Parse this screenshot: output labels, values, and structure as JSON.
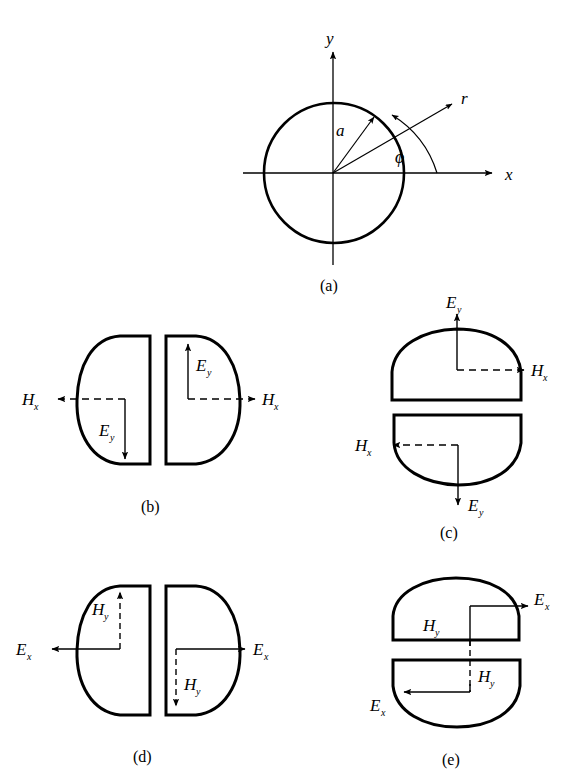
{
  "figure": {
    "background_color": "#ffffff",
    "stroke_color": "#000000"
  },
  "panels": [
    {
      "id": "a",
      "caption": "(a)",
      "description": "Circular cross-section with polar coordinate system",
      "labels": {
        "y_axis": "y",
        "x_axis": "x",
        "radius": "a",
        "radial": "r",
        "angle": "ϕ"
      }
    },
    {
      "id": "b",
      "caption": "(b)",
      "description": "Two vertical D-shaped lobes, solid E_y vertical arrows, dashed H_x horizontal arrows",
      "labels": {
        "h_left": "H",
        "h_left_sub": "x",
        "h_right": "H",
        "h_right_sub": "x",
        "e_left": "E",
        "e_left_sub": "y",
        "e_right": "E",
        "e_right_sub": "y"
      }
    },
    {
      "id": "c",
      "caption": "(c)",
      "description": "Two horizontal D-shaped lobes, solid E_y vertical arrows, dashed H_x horizontal arrows",
      "labels": {
        "e_top": "E",
        "e_top_sub": "y",
        "h_top": "H",
        "h_top_sub": "x",
        "h_bottom": "H",
        "h_bottom_sub": "x",
        "e_bottom": "E",
        "e_bottom_sub": "y"
      }
    },
    {
      "id": "d",
      "caption": "(d)",
      "description": "Two vertical D-shaped lobes, solid E_x horizontal arrows, dashed H_y vertical arrows",
      "labels": {
        "h_left": "H",
        "h_left_sub": "y",
        "h_right": "H",
        "h_right_sub": "y",
        "e_left": "E",
        "e_left_sub": "x",
        "e_right": "E",
        "e_right_sub": "x"
      }
    },
    {
      "id": "e",
      "caption": "(e)",
      "description": "Two horizontal D-shaped lobes, solid E_x horizontal arrows, dashed H_y vertical line spanning both lobes",
      "labels": {
        "e_top": "E",
        "e_top_sub": "x",
        "h_top": "H",
        "h_top_sub": "y",
        "h_bottom": "H",
        "h_bottom_sub": "y",
        "e_bottom": "E",
        "e_bottom_sub": "x"
      }
    }
  ]
}
